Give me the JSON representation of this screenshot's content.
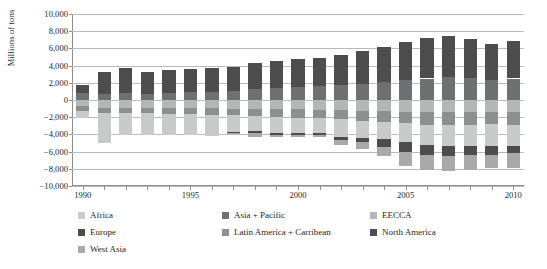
{
  "chart_data": {
    "type": "bar",
    "subtype": "stacked-diverging",
    "title": "",
    "xlabel": "",
    "ylabel": "Millions of tons",
    "ylim": [
      -10000,
      10000
    ],
    "ytick_step": 2000,
    "ytick_labels": [
      "10,000",
      "8,000",
      "6,000",
      "4,000",
      "2,000",
      "0",
      "−2,000",
      "−4,000",
      "−6,000",
      "−8,000",
      "−10,000"
    ],
    "ytick_values": [
      10000,
      8000,
      6000,
      4000,
      2000,
      0,
      -2000,
      -4000,
      -6000,
      -8000,
      -10000
    ],
    "xlim": [
      1989.4,
      2010.6
    ],
    "x_tick_labels": [
      "1990",
      "1995",
      "2000",
      "2005",
      "2010"
    ],
    "x_tick_values": [
      1990,
      1995,
      2000,
      2005,
      2010
    ],
    "grid": true,
    "legend_position": "bottom",
    "categories": [
      1990,
      1991,
      1992,
      1993,
      1994,
      1995,
      1996,
      1997,
      1998,
      1999,
      2000,
      2001,
      2002,
      2003,
      2004,
      2005,
      2006,
      2007,
      2008,
      2009,
      2010
    ],
    "series": [
      {
        "name": "North America",
        "color": "#4d4d4f",
        "side": "positive",
        "values": [
          900,
          2550,
          2900,
          2550,
          2700,
          2750,
          2800,
          2750,
          2950,
          3150,
          3250,
          3250,
          3500,
          3800,
          4150,
          4500,
          4700,
          4800,
          4500,
          4200,
          4400
        ]
      },
      {
        "name": "Asia + Pacific",
        "color": "#6f7072",
        "side": "positive",
        "values": [
          800,
          700,
          800,
          750,
          800,
          900,
          900,
          1100,
          1300,
          1400,
          1500,
          1600,
          1700,
          1850,
          2050,
          2300,
          2500,
          2650,
          2600,
          2350,
          2500
        ]
      },
      {
        "name": "EECCA",
        "color": "#b5b6b8",
        "side": "negative",
        "values": [
          -750,
          -900,
          -900,
          -900,
          -900,
          -950,
          -950,
          -1000,
          -1000,
          -1050,
          -1100,
          -1150,
          -1200,
          -1250,
          -1300,
          -1350,
          -1400,
          -1450,
          -1450,
          -1400,
          -1450
        ]
      },
      {
        "name": "Latin America + Carribean",
        "color": "#8e8f91",
        "side": "negative",
        "values": [
          -500,
          -600,
          -650,
          -650,
          -700,
          -700,
          -750,
          -800,
          -850,
          -900,
          -950,
          -1000,
          -1050,
          -1150,
          -1250,
          -1350,
          -1450,
          -1500,
          -1500,
          -1400,
          -1450
        ]
      },
      {
        "name": "Africa",
        "color": "#c9cacb",
        "side": "negative",
        "values": [
          -850,
          -3500,
          -2500,
          -2550,
          -2500,
          -2400,
          -2450,
          -1950,
          -1700,
          -1900,
          -1750,
          -1700,
          -2000,
          -2050,
          -1950,
          -2200,
          -2350,
          -2400,
          -2350,
          -2500,
          -2500
        ]
      },
      {
        "name": "Europe",
        "color": "#4d4d4f",
        "side": "negative",
        "values": [
          0,
          0,
          0,
          0,
          0,
          0,
          0,
          -100,
          -250,
          -200,
          -250,
          -200,
          -350,
          -400,
          -950,
          -1150,
          -1150,
          -1150,
          -1100,
          -1100,
          -750
        ]
      },
      {
        "name": "West Asia",
        "color": "#a8a9ab",
        "side": "negative",
        "values": [
          0,
          0,
          0,
          0,
          0,
          0,
          0,
          -150,
          -550,
          -200,
          -300,
          -200,
          -600,
          -850,
          -1050,
          -1600,
          -1750,
          -1750,
          -1700,
          -1500,
          -1800
        ]
      }
    ]
  },
  "legend": {
    "items": [
      {
        "label": "Africa",
        "color": "#c9cacb",
        "row": 0,
        "col": 0
      },
      {
        "label": "Asia + Pacific",
        "color": "#6f7072",
        "row": 0,
        "col": 1
      },
      {
        "label": "EECCA",
        "color": "#b5b6b8",
        "row": 0,
        "col": 2
      },
      {
        "label": "Europe",
        "color": "#4d4d4f",
        "row": 1,
        "col": 0
      },
      {
        "label": "Latin America + Carribean",
        "color": "#8e8f91",
        "row": 1,
        "col": 1
      },
      {
        "label": "North America",
        "color": "#4d4d4f",
        "row": 1,
        "col": 2
      },
      {
        "label": "West Asia",
        "color": "#a8a9ab",
        "row": 2,
        "col": 0
      }
    ]
  }
}
